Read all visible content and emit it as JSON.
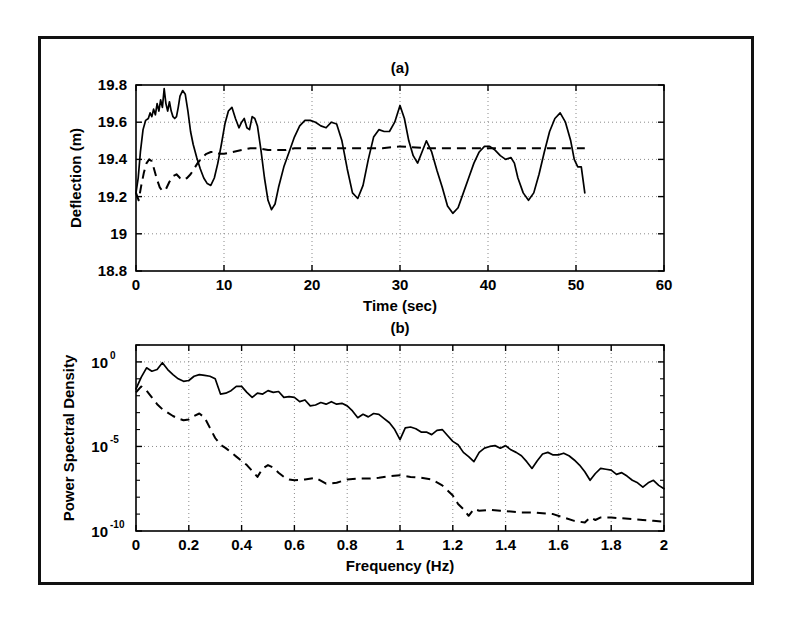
{
  "figure": {
    "background_color": "#ffffff",
    "frame_color": "#111111",
    "curve_color": "#000000",
    "grid_color": "#8a8a8a"
  },
  "panel_a": {
    "title": "(a)",
    "xlabel": "Time (sec)",
    "ylabel": "Deflection (m)",
    "xticklabels": [
      "0",
      "10",
      "20",
      "30",
      "40",
      "50",
      "60"
    ],
    "yticklabels": [
      "18.8",
      "19",
      "19.2",
      "19.4",
      "19.6",
      "19.8"
    ]
  },
  "panel_b": {
    "title": "(b)",
    "xlabel": "Frequency (Hz)",
    "ylabel": "Power Spectral Density",
    "xticklabels": [
      "0",
      "0.2",
      "0.4",
      "0.6",
      "0.8",
      "1",
      "1.2",
      "1.4",
      "1.6",
      "1.8",
      "2"
    ],
    "yticklabels": [
      "10",
      "10",
      "10"
    ],
    "yticksuper": [
      "0",
      "-5",
      "-10"
    ]
  },
  "chart_data": [
    {
      "type": "line",
      "panel": "a",
      "title": "(a)",
      "xlabel": "Time (sec)",
      "ylabel": "Deflection (m)",
      "xlim": [
        0,
        60
      ],
      "ylim": [
        18.8,
        19.8
      ],
      "xticks": [
        0,
        10,
        20,
        30,
        40,
        50,
        60
      ],
      "yticks": [
        18.8,
        19.0,
        19.2,
        19.4,
        19.6,
        19.8
      ],
      "grid": true,
      "legend": "none",
      "series": [
        {
          "name": "measured-deflection",
          "style": "solid",
          "x": [
            0.0,
            0.25,
            0.5,
            0.8,
            1.1,
            1.4,
            1.6,
            1.8,
            2.0,
            2.2,
            2.4,
            2.6,
            2.8,
            3.0,
            3.2,
            3.4,
            3.6,
            3.8,
            4.0,
            4.2,
            4.4,
            4.6,
            4.8,
            5.0,
            5.3,
            5.6,
            5.9,
            6.2,
            6.5,
            6.9,
            7.3,
            7.7,
            8.1,
            8.5,
            8.9,
            9.3,
            9.7,
            10.1,
            10.5,
            10.9,
            11.3,
            11.7,
            12.0,
            12.3,
            12.6,
            12.9,
            13.2,
            13.5,
            13.8,
            14.2,
            14.6,
            15.0,
            15.4,
            15.8,
            16.2,
            16.8,
            17.4,
            18.0,
            18.6,
            19.2,
            19.8,
            20.4,
            21.0,
            21.6,
            22.2,
            22.8,
            23.4,
            24.0,
            24.6,
            25.2,
            25.8,
            26.4,
            27.0,
            27.6,
            28.2,
            28.8,
            29.4,
            30.0,
            30.5,
            31.0,
            31.5,
            32.0,
            32.5,
            33.0,
            33.6,
            34.2,
            34.8,
            35.4,
            36.0,
            36.6,
            37.2,
            37.8,
            38.4,
            39.0,
            39.6,
            40.2,
            40.8,
            41.4,
            42.0,
            42.6,
            43.0,
            43.4,
            44.0,
            44.6,
            45.2,
            45.8,
            46.4,
            47.0,
            47.6,
            48.2,
            48.8,
            49.4,
            49.8,
            50.2,
            50.6,
            51.0
          ],
          "y": [
            19.22,
            19.3,
            19.44,
            19.56,
            19.61,
            19.62,
            19.65,
            19.63,
            19.67,
            19.64,
            19.7,
            19.66,
            19.72,
            19.68,
            19.78,
            19.7,
            19.66,
            19.71,
            19.66,
            19.63,
            19.62,
            19.63,
            19.68,
            19.74,
            19.77,
            19.75,
            19.66,
            19.55,
            19.48,
            19.41,
            19.35,
            19.3,
            19.27,
            19.26,
            19.3,
            19.38,
            19.48,
            19.59,
            19.66,
            19.68,
            19.62,
            19.57,
            19.6,
            19.62,
            19.57,
            19.56,
            19.63,
            19.62,
            19.58,
            19.45,
            19.3,
            19.18,
            19.13,
            19.16,
            19.25,
            19.36,
            19.44,
            19.52,
            19.58,
            19.61,
            19.61,
            19.6,
            19.58,
            19.57,
            19.6,
            19.59,
            19.5,
            19.35,
            19.22,
            19.19,
            19.26,
            19.4,
            19.52,
            19.56,
            19.55,
            19.55,
            19.6,
            19.69,
            19.62,
            19.5,
            19.42,
            19.38,
            19.44,
            19.5,
            19.44,
            19.34,
            19.25,
            19.15,
            19.11,
            19.14,
            19.22,
            19.3,
            19.38,
            19.44,
            19.47,
            19.47,
            19.45,
            19.42,
            19.4,
            19.41,
            19.38,
            19.3,
            19.22,
            19.18,
            19.22,
            19.32,
            19.44,
            19.55,
            19.62,
            19.65,
            19.6,
            19.5,
            19.4,
            19.36,
            19.36,
            19.22,
            19.08,
            18.97
          ],
          "note": "irregular oscillating measured response"
        },
        {
          "name": "reference-deflection",
          "style": "dashed",
          "x": [
            0.0,
            0.3,
            0.6,
            0.9,
            1.2,
            1.5,
            1.8,
            2.1,
            2.4,
            2.7,
            3.0,
            3.4,
            3.8,
            4.2,
            4.6,
            5.0,
            5.4,
            5.8,
            6.2,
            6.6,
            7.0,
            7.5,
            8.0,
            8.5,
            9.0,
            9.5,
            10.0,
            11.0,
            12.0,
            13.0,
            14.0,
            15.0,
            16.0,
            17.0,
            18.0,
            20.0,
            22.0,
            24.0,
            26.0,
            28.0,
            30.0,
            33.0,
            36.0,
            39.0,
            42.0,
            45.0,
            48.0,
            50.0,
            51.0
          ],
          "y": [
            19.22,
            19.18,
            19.26,
            19.33,
            19.38,
            19.4,
            19.39,
            19.34,
            19.29,
            19.25,
            19.23,
            19.24,
            19.28,
            19.31,
            19.32,
            19.3,
            19.29,
            19.3,
            19.32,
            19.35,
            19.38,
            19.41,
            19.43,
            19.44,
            19.44,
            19.43,
            19.43,
            19.44,
            19.45,
            19.46,
            19.46,
            19.45,
            19.45,
            19.45,
            19.46,
            19.46,
            19.46,
            19.46,
            19.46,
            19.46,
            19.47,
            19.46,
            19.46,
            19.46,
            19.46,
            19.46,
            19.46,
            19.46,
            19.46
          ],
          "note": "smooth drifting reference settling near 19.46"
        }
      ]
    },
    {
      "type": "line",
      "panel": "b",
      "title": "(b)",
      "xlabel": "Frequency (Hz)",
      "ylabel": "Power Spectral Density",
      "xlim": [
        0,
        2
      ],
      "ylim": [
        1e-10,
        10
      ],
      "yscale": "log",
      "xticks": [
        0,
        0.2,
        0.4,
        0.6,
        0.8,
        1.0,
        1.2,
        1.4,
        1.6,
        1.8,
        2.0
      ],
      "yticks": [
        1e-10,
        1e-05,
        1
      ],
      "grid": true,
      "legend": "none",
      "series": [
        {
          "name": "measured-psd",
          "style": "solid",
          "x": [
            0.0,
            0.02,
            0.04,
            0.06,
            0.08,
            0.1,
            0.12,
            0.14,
            0.16,
            0.18,
            0.2,
            0.22,
            0.24,
            0.26,
            0.28,
            0.3,
            0.32,
            0.34,
            0.36,
            0.38,
            0.4,
            0.42,
            0.44,
            0.46,
            0.48,
            0.5,
            0.52,
            0.54,
            0.56,
            0.58,
            0.6,
            0.62,
            0.64,
            0.66,
            0.68,
            0.7,
            0.72,
            0.74,
            0.76,
            0.78,
            0.8,
            0.82,
            0.84,
            0.86,
            0.88,
            0.9,
            0.92,
            0.94,
            0.96,
            0.98,
            1.0,
            1.02,
            1.04,
            1.06,
            1.08,
            1.1,
            1.12,
            1.14,
            1.16,
            1.18,
            1.2,
            1.22,
            1.24,
            1.26,
            1.28,
            1.3,
            1.32,
            1.34,
            1.36,
            1.38,
            1.4,
            1.42,
            1.44,
            1.46,
            1.48,
            1.5,
            1.52,
            1.54,
            1.56,
            1.58,
            1.6,
            1.62,
            1.64,
            1.66,
            1.68,
            1.7,
            1.72,
            1.74,
            1.76,
            1.78,
            1.8,
            1.82,
            1.84,
            1.86,
            1.88,
            1.9,
            1.92,
            1.94,
            1.96,
            1.98,
            2.0
          ],
          "y_log10": [
            -1.6,
            -0.9,
            -0.35,
            -0.55,
            -0.45,
            -0.05,
            -0.45,
            -0.75,
            -1.0,
            -1.15,
            -1.1,
            -0.85,
            -0.75,
            -0.8,
            -0.85,
            -1.0,
            -1.9,
            -1.85,
            -1.7,
            -1.45,
            -1.45,
            -1.8,
            -2.1,
            -1.85,
            -1.9,
            -1.7,
            -1.8,
            -1.75,
            -2.1,
            -2.05,
            -2.1,
            -2.35,
            -2.25,
            -2.6,
            -2.55,
            -2.4,
            -2.5,
            -2.35,
            -2.5,
            -2.45,
            -2.6,
            -2.9,
            -3.3,
            -3.1,
            -3.25,
            -3.05,
            -3.1,
            -3.35,
            -3.6,
            -4.0,
            -4.6,
            -3.9,
            -3.85,
            -3.95,
            -4.15,
            -4.15,
            -4.3,
            -4.05,
            -4.0,
            -4.35,
            -4.7,
            -4.9,
            -5.35,
            -5.6,
            -5.9,
            -5.35,
            -5.1,
            -5.0,
            -4.95,
            -5.1,
            -4.95,
            -5.2,
            -5.35,
            -5.55,
            -5.9,
            -6.3,
            -5.85,
            -5.45,
            -5.35,
            -5.5,
            -5.5,
            -5.4,
            -5.55,
            -5.8,
            -6.1,
            -6.5,
            -7.0,
            -6.6,
            -6.3,
            -6.35,
            -6.4,
            -6.65,
            -6.55,
            -6.75,
            -7.0,
            -7.15,
            -7.4,
            -7.15,
            -7.0,
            -7.3,
            -7.5
          ],
          "note": "broadband decaying spectrum of measured signal"
        },
        {
          "name": "reference-psd",
          "style": "dashed",
          "x": [
            0.0,
            0.02,
            0.04,
            0.06,
            0.08,
            0.1,
            0.12,
            0.14,
            0.16,
            0.18,
            0.2,
            0.22,
            0.24,
            0.26,
            0.28,
            0.3,
            0.32,
            0.34,
            0.36,
            0.38,
            0.4,
            0.42,
            0.44,
            0.46,
            0.48,
            0.5,
            0.52,
            0.54,
            0.56,
            0.58,
            0.6,
            0.64,
            0.68,
            0.72,
            0.76,
            0.8,
            0.84,
            0.88,
            0.92,
            0.96,
            1.0,
            1.04,
            1.08,
            1.12,
            1.16,
            1.2,
            1.22,
            1.24,
            1.26,
            1.28,
            1.3,
            1.34,
            1.38,
            1.42,
            1.46,
            1.5,
            1.54,
            1.58,
            1.62,
            1.66,
            1.7,
            1.72,
            1.74,
            1.76,
            1.8,
            1.84,
            1.88,
            1.92,
            1.96,
            2.0
          ],
          "y_log10": [
            -1.8,
            -1.45,
            -1.7,
            -2.1,
            -2.5,
            -2.8,
            -3.0,
            -3.2,
            -3.35,
            -3.45,
            -3.4,
            -3.2,
            -3.05,
            -3.3,
            -3.9,
            -4.5,
            -4.9,
            -5.1,
            -5.35,
            -5.6,
            -5.85,
            -6.1,
            -6.45,
            -6.8,
            -6.3,
            -6.1,
            -6.25,
            -6.55,
            -6.8,
            -6.95,
            -7.0,
            -6.95,
            -6.85,
            -7.2,
            -7.15,
            -6.95,
            -6.9,
            -6.9,
            -6.85,
            -6.75,
            -6.7,
            -6.8,
            -6.85,
            -6.95,
            -7.3,
            -7.9,
            -8.4,
            -8.7,
            -9.1,
            -8.7,
            -8.8,
            -8.75,
            -8.8,
            -8.85,
            -8.9,
            -8.9,
            -8.95,
            -9.0,
            -9.2,
            -9.4,
            -9.5,
            -9.2,
            -9.35,
            -9.2,
            -9.2,
            -9.25,
            -9.3,
            -9.35,
            -9.4,
            -9.45
          ],
          "note": "rapidly decaying reference spectrum, floors near 1e-9"
        }
      ]
    }
  ]
}
